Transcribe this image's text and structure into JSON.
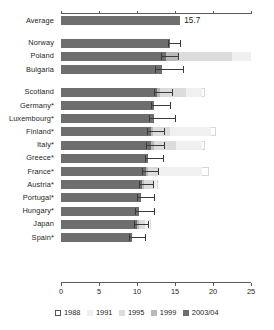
{
  "chart_data": {
    "type": "bar",
    "orientation": "horizontal",
    "title": "",
    "xlabel": "",
    "ylabel": "",
    "xlim": [
      0,
      25
    ],
    "xticks": [
      0,
      5,
      10,
      15,
      20,
      25
    ],
    "xtick_labels": [
      "0",
      "5",
      "10",
      "15",
      "20",
      "25"
    ],
    "grid": false,
    "legend_position": "bottom",
    "legend": [
      "1988",
      "1991",
      "1995",
      "1999",
      "2003/04"
    ],
    "series": [
      {
        "name": "1988",
        "color": "#ffffff"
      },
      {
        "name": "1991",
        "color": "#f0f0f0"
      },
      {
        "name": "1995",
        "color": "#dcdcdc"
      },
      {
        "name": "1999",
        "color": "#b9b9b9"
      },
      {
        "name": "2003/04",
        "color": "#6e6e6e"
      }
    ],
    "categories": [
      "Average",
      "Norway",
      "Poland",
      "Bulgaria",
      "Scotland",
      "Germany*",
      "Luxembourg*",
      "Finland*",
      "Italy*",
      "Greece*",
      "France*",
      "Austria*",
      "Portugal*",
      "Hungary*",
      "Japan",
      "Spain*"
    ],
    "rows": [
      {
        "category": "Average",
        "v2003": 15.7,
        "v1999": 15.7,
        "v1995": 15.7,
        "v1991": 15.7,
        "v1988": 15.7,
        "err_low": 15.7,
        "err_high": 15.7,
        "value_label": "15.7",
        "show_label": true,
        "spacer_after": true
      },
      {
        "category": "Norway",
        "v2003": 14.4,
        "v1999": 14.4,
        "v1995": 14.4,
        "v1991": 14.4,
        "v1988": 14.4,
        "err_low": 14.1,
        "err_high": 15.6,
        "value_label": "",
        "show_label": false,
        "spacer_after": false
      },
      {
        "category": "Poland",
        "v2003": 13.8,
        "v1999": 15.4,
        "v1995": 22.5,
        "v1991": 26.6,
        "v1988": 26.6,
        "err_low": 13.2,
        "err_high": 15.4,
        "value_label": "",
        "show_label": false,
        "spacer_after": false
      },
      {
        "category": "Bulgaria",
        "v2003": 13.3,
        "v1999": 13.3,
        "v1995": 13.3,
        "v1991": 13.3,
        "v1988": 13.3,
        "err_low": 12.4,
        "err_high": 16.0,
        "value_label": "",
        "show_label": false,
        "spacer_after": true
      },
      {
        "category": "Scotland",
        "v2003": 12.6,
        "v1999": 13.0,
        "v1995": 16.4,
        "v1991": 18.5,
        "v1988": 18.9,
        "err_low": 12.2,
        "err_high": 14.6,
        "value_label": "",
        "show_label": false,
        "spacer_after": false
      },
      {
        "category": "Germany*",
        "v2003": 12.3,
        "v1999": 12.3,
        "v1995": 12.3,
        "v1991": 12.3,
        "v1988": 12.3,
        "err_low": 11.8,
        "err_high": 14.4,
        "value_label": "",
        "show_label": false,
        "spacer_after": false
      },
      {
        "category": "Luxembourg*",
        "v2003": 12.2,
        "v1999": 12.2,
        "v1995": 12.2,
        "v1991": 12.2,
        "v1988": 12.2,
        "err_low": 11.6,
        "err_high": 15.0,
        "value_label": "",
        "show_label": false,
        "spacer_after": false
      },
      {
        "category": "Finland*",
        "v2003": 11.9,
        "v1999": 12.1,
        "v1995": 14.3,
        "v1991": 19.8,
        "v1988": 20.4,
        "err_low": 11.3,
        "err_high": 13.6,
        "value_label": "",
        "show_label": false,
        "spacer_after": false
      },
      {
        "category": "Italy*",
        "v2003": 11.8,
        "v1999": 12.2,
        "v1995": 15.1,
        "v1991": 18.6,
        "v1988": 19.0,
        "err_low": 11.2,
        "err_high": 13.5,
        "value_label": "",
        "show_label": false,
        "spacer_after": false
      },
      {
        "category": "Greece*",
        "v2003": 11.5,
        "v1999": 11.5,
        "v1995": 11.5,
        "v1991": 11.5,
        "v1988": 11.5,
        "err_low": 11.0,
        "err_high": 13.4,
        "value_label": "",
        "show_label": false,
        "spacer_after": false
      },
      {
        "category": "France*",
        "v2003": 11.2,
        "v1999": 11.4,
        "v1995": 12.8,
        "v1991": 18.6,
        "v1988": 19.5,
        "err_low": 10.7,
        "err_high": 12.8,
        "value_label": "",
        "show_label": false,
        "spacer_after": false
      },
      {
        "category": "Austria*",
        "v2003": 10.7,
        "v1999": 10.9,
        "v1995": 12.2,
        "v1991": 12.6,
        "v1988": 12.8,
        "err_low": 10.2,
        "err_high": 12.1,
        "value_label": "",
        "show_label": false,
        "spacer_after": false
      },
      {
        "category": "Portugal*",
        "v2003": 10.5,
        "v1999": 10.5,
        "v1995": 10.5,
        "v1991": 10.5,
        "v1988": 10.5,
        "err_low": 10.0,
        "err_high": 12.3,
        "value_label": "",
        "show_label": false,
        "spacer_after": false
      },
      {
        "category": "Hungary*",
        "v2003": 10.2,
        "v1999": 10.2,
        "v1995": 10.2,
        "v1991": 10.2,
        "v1988": 10.2,
        "err_low": 9.8,
        "err_high": 12.2,
        "value_label": "",
        "show_label": false,
        "spacer_after": false
      },
      {
        "category": "Japan",
        "v2003": 10.0,
        "v1999": 10.2,
        "v1995": 11.0,
        "v1991": 11.6,
        "v1988": 11.8,
        "err_low": 9.6,
        "err_high": 11.4,
        "value_label": "",
        "show_label": false,
        "spacer_after": false
      },
      {
        "category": "Spain*",
        "v2003": 9.4,
        "v1999": 9.4,
        "v1995": 9.4,
        "v1991": 9.4,
        "v1988": 9.4,
        "err_low": 9.0,
        "err_high": 11.1,
        "value_label": "",
        "show_label": false,
        "spacer_after": false
      }
    ]
  }
}
